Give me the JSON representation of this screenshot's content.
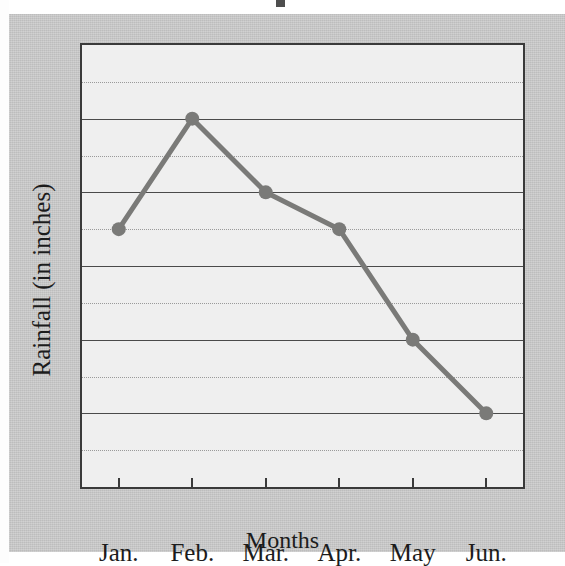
{
  "figure": {
    "background_color": "#c8c8c8",
    "plot_background_color": "#efefef",
    "frame_color": "#3a3a3a",
    "series_color": "#7a7a78"
  },
  "chart_data": {
    "type": "line",
    "title": "",
    "xlabel": "Months",
    "ylabel": "Rainfall (in inches)",
    "categories": [
      "Jan.",
      "Feb.",
      "Mar.",
      "Apr.",
      "May",
      "Jun."
    ],
    "values": [
      3.5,
      5.0,
      4.0,
      3.5,
      2.0,
      1.0
    ],
    "series": [
      {
        "name": "Rainfall",
        "values": [
          3.5,
          5.0,
          4.0,
          3.5,
          2.0,
          1.0
        ],
        "color": "#7a7a78",
        "marker": "circle"
      }
    ],
    "ylim": [
      0,
      6
    ],
    "y_ticks": [
      0,
      1,
      2,
      3,
      4,
      5,
      6
    ],
    "y_tick_labels": [
      "0",
      "1",
      "2",
      "3",
      "4",
      "5",
      "6"
    ],
    "y_minor_ticks": [
      0.5,
      1.5,
      2.5,
      3.5,
      4.5,
      5.5
    ],
    "grid": {
      "major_horizontal": true,
      "minor_horizontal": true,
      "vertical": false,
      "major_style": "solid",
      "minor_style": "dotted"
    },
    "legend": {
      "visible": false,
      "position": "none"
    },
    "annotations": []
  }
}
